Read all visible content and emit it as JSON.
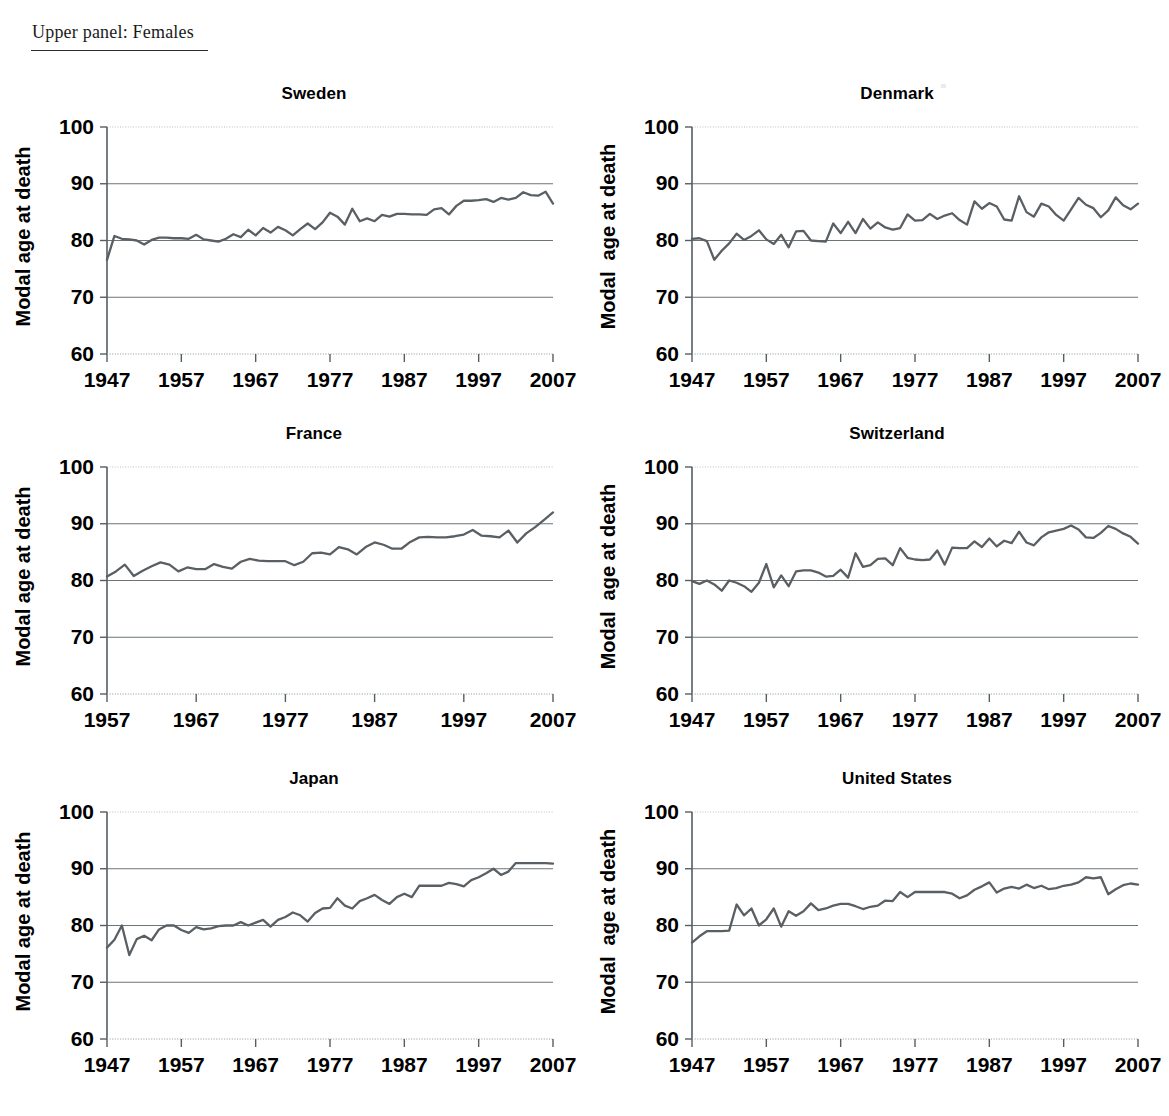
{
  "page": {
    "panel_heading": "Upper panel: Females"
  },
  "axis": {
    "y_ticks": [
      60,
      70,
      80,
      90,
      100
    ],
    "y_label_major": "Modal age at death",
    "y_label_wide": "Modal  age at death",
    "ylim": [
      60,
      100
    ],
    "x_ticks_full": [
      1947,
      1957,
      1967,
      1977,
      1987,
      1997,
      2007
    ],
    "x_ticks_france": [
      1957,
      1967,
      1977,
      1987,
      1997,
      2007
    ],
    "xlim_full": [
      1947,
      2007
    ],
    "xlim_france": [
      1957,
      2007
    ]
  },
  "colors": {
    "line": "#5a5f63",
    "grid": "#6b7479",
    "axis": "#555e63",
    "text": "#000000",
    "background": "#ffffff"
  },
  "chart_data": [
    {
      "type": "line",
      "title": "Sweden",
      "xlabel": "",
      "ylabel": "Modal age at death",
      "ylim": [
        60,
        100
      ],
      "xlim": [
        1947,
        2007
      ],
      "grid": true,
      "legend": "none",
      "x": [
        1947,
        1948,
        1949,
        1950,
        1951,
        1952,
        1953,
        1954,
        1955,
        1956,
        1957,
        1958,
        1959,
        1960,
        1961,
        1962,
        1963,
        1964,
        1965,
        1966,
        1967,
        1968,
        1969,
        1970,
        1971,
        1972,
        1973,
        1974,
        1975,
        1976,
        1977,
        1978,
        1979,
        1980,
        1981,
        1982,
        1983,
        1984,
        1985,
        1986,
        1987,
        1988,
        1989,
        1990,
        1991,
        1992,
        1993,
        1994,
        1995,
        1996,
        1997,
        1998,
        1999,
        2000,
        2001,
        2002,
        2003,
        2004,
        2005,
        2006,
        2007
      ],
      "values": [
        76.6,
        80.8,
        80.3,
        80.2,
        80.0,
        79.3,
        80.1,
        80.5,
        80.5,
        80.4,
        80.4,
        80.3,
        81.0,
        80.2,
        80.0,
        79.8,
        80.3,
        81.1,
        80.6,
        81.9,
        80.9,
        82.2,
        81.4,
        82.4,
        81.8,
        80.9,
        82.0,
        83.0,
        82.0,
        83.2,
        84.9,
        84.2,
        82.8,
        85.6,
        83.4,
        83.9,
        83.4,
        84.5,
        84.2,
        84.7,
        84.7,
        84.6,
        84.6,
        84.5,
        85.5,
        85.7,
        84.6,
        86.1,
        87.0,
        87.0,
        87.1,
        87.3,
        86.8,
        87.5,
        87.2,
        87.5,
        88.5,
        88.0,
        87.9,
        88.6,
        86.5
      ]
    },
    {
      "type": "line",
      "title": "Denmark",
      "xlabel": "",
      "ylabel": "Modal  age at death",
      "ylim": [
        60,
        100
      ],
      "xlim": [
        1947,
        2007
      ],
      "grid": true,
      "legend": "none",
      "x": [
        1947,
        1948,
        1949,
        1950,
        1951,
        1952,
        1953,
        1954,
        1955,
        1956,
        1957,
        1958,
        1959,
        1960,
        1961,
        1962,
        1963,
        1964,
        1965,
        1966,
        1967,
        1968,
        1969,
        1970,
        1971,
        1972,
        1973,
        1974,
        1975,
        1976,
        1977,
        1978,
        1979,
        1980,
        1981,
        1982,
        1983,
        1984,
        1985,
        1986,
        1987,
        1988,
        1989,
        1990,
        1991,
        1992,
        1993,
        1994,
        1995,
        1996,
        1997,
        1998,
        1999,
        2000,
        2001,
        2002,
        2003,
        2004,
        2005,
        2006,
        2007
      ],
      "values": [
        80.3,
        80.4,
        79.9,
        76.6,
        78.2,
        79.5,
        81.2,
        80.1,
        80.8,
        81.8,
        80.2,
        79.4,
        81.0,
        78.8,
        81.6,
        81.7,
        80.0,
        79.9,
        79.8,
        83.0,
        81.3,
        83.3,
        81.3,
        83.8,
        82.1,
        83.2,
        82.3,
        81.9,
        82.2,
        84.6,
        83.5,
        83.6,
        84.7,
        83.8,
        84.4,
        84.8,
        83.6,
        82.8,
        86.9,
        85.6,
        86.6,
        86.0,
        83.7,
        83.5,
        87.8,
        85.0,
        84.2,
        86.5,
        86.0,
        84.5,
        83.5,
        85.5,
        87.5,
        86.3,
        85.7,
        84.1,
        85.3,
        87.6,
        86.2,
        85.5,
        86.5
      ]
    },
    {
      "type": "line",
      "title": "France",
      "xlabel": "",
      "ylabel": "Modal age at death",
      "ylim": [
        60,
        100
      ],
      "xlim": [
        1957,
        2007
      ],
      "grid": true,
      "legend": "none",
      "x": [
        1957,
        1958,
        1959,
        1960,
        1961,
        1962,
        1963,
        1964,
        1965,
        1966,
        1967,
        1968,
        1969,
        1970,
        1971,
        1972,
        1973,
        1974,
        1975,
        1976,
        1977,
        1978,
        1979,
        1980,
        1981,
        1982,
        1983,
        1984,
        1985,
        1986,
        1987,
        1988,
        1989,
        1990,
        1991,
        1992,
        1993,
        1994,
        1995,
        1996,
        1997,
        1998,
        1999,
        2000,
        2001,
        2002,
        2003,
        2004,
        2005,
        2006,
        2007
      ],
      "values": [
        80.7,
        81.6,
        82.8,
        80.8,
        81.7,
        82.5,
        83.2,
        82.8,
        81.6,
        82.3,
        82.0,
        82.0,
        82.9,
        82.4,
        82.1,
        83.3,
        83.8,
        83.5,
        83.4,
        83.4,
        83.4,
        82.7,
        83.3,
        84.8,
        84.9,
        84.6,
        85.9,
        85.5,
        84.6,
        85.9,
        86.7,
        86.3,
        85.6,
        85.6,
        86.8,
        87.6,
        87.7,
        87.6,
        87.6,
        87.8,
        88.1,
        88.9,
        87.9,
        87.8,
        87.6,
        88.8,
        86.7,
        88.3,
        89.4,
        90.7,
        92.0
      ]
    },
    {
      "type": "line",
      "title": "Switzerland",
      "xlabel": "",
      "ylabel": "Modal  age at death",
      "ylim": [
        60,
        100
      ],
      "xlim": [
        1947,
        2007
      ],
      "grid": true,
      "legend": "none",
      "x": [
        1947,
        1948,
        1949,
        1950,
        1951,
        1952,
        1953,
        1954,
        1955,
        1956,
        1957,
        1958,
        1959,
        1960,
        1961,
        1962,
        1963,
        1964,
        1965,
        1966,
        1967,
        1968,
        1969,
        1970,
        1971,
        1972,
        1973,
        1974,
        1975,
        1976,
        1977,
        1978,
        1979,
        1980,
        1981,
        1982,
        1983,
        1984,
        1985,
        1986,
        1987,
        1988,
        1989,
        1990,
        1991,
        1992,
        1993,
        1994,
        1995,
        1996,
        1997,
        1998,
        1999,
        2000,
        2001,
        2002,
        2003,
        2004,
        2005,
        2006,
        2007
      ],
      "values": [
        79.9,
        79.4,
        80.0,
        79.3,
        78.2,
        80.0,
        79.6,
        79.0,
        78.0,
        79.6,
        82.9,
        78.8,
        80.9,
        79.0,
        81.6,
        81.8,
        81.8,
        81.4,
        80.7,
        80.8,
        81.9,
        80.5,
        84.8,
        82.4,
        82.7,
        83.8,
        83.9,
        82.7,
        85.7,
        84.0,
        83.7,
        83.6,
        83.7,
        85.3,
        82.8,
        85.8,
        85.7,
        85.7,
        86.9,
        85.9,
        87.4,
        86.0,
        87.0,
        86.6,
        88.6,
        86.7,
        86.2,
        87.6,
        88.5,
        88.8,
        89.1,
        89.7,
        89.0,
        87.6,
        87.5,
        88.4,
        89.6,
        89.1,
        88.3,
        87.7,
        86.5
      ]
    },
    {
      "type": "line",
      "title": "Japan",
      "xlabel": "",
      "ylabel": "Modal age at death",
      "ylim": [
        60,
        100
      ],
      "xlim": [
        1947,
        2007
      ],
      "grid": true,
      "legend": "none",
      "x": [
        1947,
        1948,
        1949,
        1950,
        1951,
        1952,
        1953,
        1954,
        1955,
        1956,
        1957,
        1958,
        1959,
        1960,
        1961,
        1962,
        1963,
        1964,
        1965,
        1966,
        1967,
        1968,
        1969,
        1970,
        1971,
        1972,
        1973,
        1974,
        1975,
        1976,
        1977,
        1978,
        1979,
        1980,
        1981,
        1982,
        1983,
        1984,
        1985,
        1986,
        1987,
        1988,
        1989,
        1990,
        1991,
        1992,
        1993,
        1994,
        1995,
        1996,
        1997,
        1998,
        1999,
        2000,
        2001,
        2002,
        2003,
        2004,
        2005,
        2006,
        2007
      ],
      "values": [
        76.1,
        77.5,
        80.0,
        74.8,
        77.6,
        78.2,
        77.4,
        79.3,
        80.0,
        80.0,
        79.2,
        78.7,
        79.7,
        79.3,
        79.5,
        79.9,
        80.0,
        80.0,
        80.6,
        80.0,
        80.5,
        81.0,
        79.8,
        81.0,
        81.5,
        82.3,
        81.8,
        80.7,
        82.2,
        83.0,
        83.1,
        84.8,
        83.5,
        83.0,
        84.3,
        84.8,
        85.4,
        84.5,
        83.8,
        85.0,
        85.6,
        85.0,
        87.0,
        87.0,
        87.0,
        87.0,
        87.5,
        87.3,
        86.9,
        88.0,
        88.5,
        89.2,
        90.0,
        88.9,
        89.5,
        91.0,
        91.0,
        91.0,
        91.0,
        91.0,
        90.9
      ]
    },
    {
      "type": "line",
      "title": "United States",
      "xlabel": "",
      "ylabel": "Modal  age at death",
      "ylim": [
        60,
        100
      ],
      "xlim": [
        1947,
        2007
      ],
      "grid": true,
      "legend": "none",
      "x": [
        1947,
        1948,
        1949,
        1950,
        1951,
        1952,
        1953,
        1954,
        1955,
        1956,
        1957,
        1958,
        1959,
        1960,
        1961,
        1962,
        1963,
        1964,
        1965,
        1966,
        1967,
        1968,
        1969,
        1970,
        1971,
        1972,
        1973,
        1974,
        1975,
        1976,
        1977,
        1978,
        1979,
        1980,
        1981,
        1982,
        1983,
        1984,
        1985,
        1986,
        1987,
        1988,
        1989,
        1990,
        1991,
        1992,
        1993,
        1994,
        1995,
        1996,
        1997,
        1998,
        1999,
        2000,
        2001,
        2002,
        2003,
        2004,
        2005,
        2006,
        2007
      ],
      "values": [
        77.0,
        78.1,
        79.0,
        79.0,
        79.0,
        79.1,
        83.7,
        81.8,
        83.0,
        80.0,
        81.1,
        83.0,
        79.8,
        82.5,
        81.7,
        82.5,
        83.9,
        82.7,
        83.0,
        83.5,
        83.8,
        83.8,
        83.4,
        82.9,
        83.3,
        83.5,
        84.4,
        84.3,
        85.9,
        85.0,
        85.9,
        85.9,
        85.9,
        85.9,
        85.9,
        85.6,
        84.8,
        85.3,
        86.3,
        86.9,
        87.6,
        85.8,
        86.5,
        86.8,
        86.5,
        87.2,
        86.6,
        87.0,
        86.4,
        86.6,
        87.0,
        87.2,
        87.6,
        88.5,
        88.3,
        88.5,
        85.5,
        86.4,
        87.1,
        87.4,
        87.2
      ]
    }
  ]
}
